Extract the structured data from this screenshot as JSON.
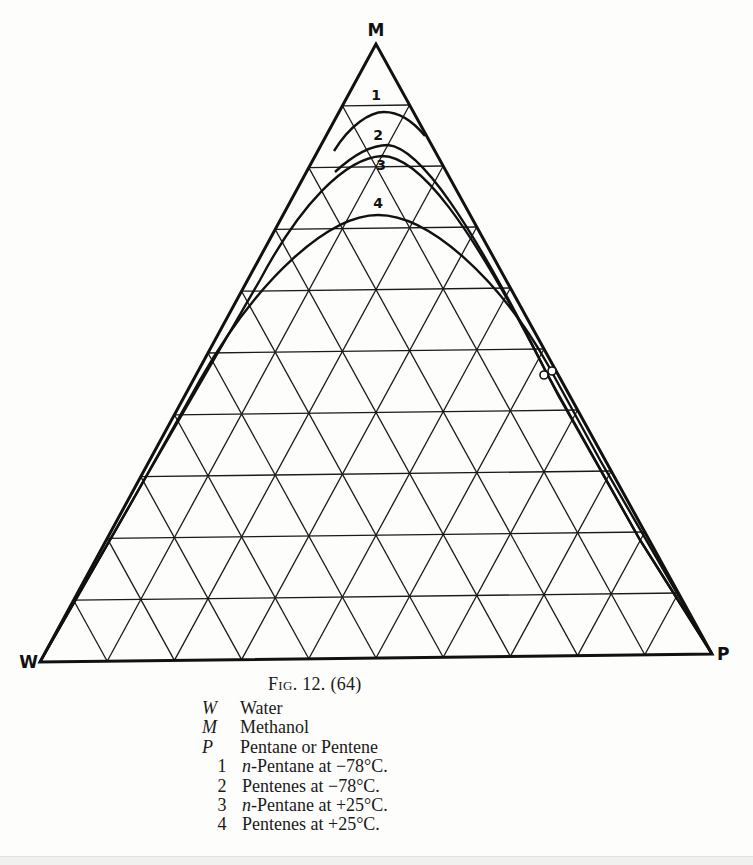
{
  "figure": {
    "title_prefix": "F",
    "title_smallcaps": "IG",
    "title_rest": ". 12. (64)",
    "full_title": "Fig. 12. (64)"
  },
  "vertices": {
    "top": {
      "label": "M",
      "x": 376,
      "y": 44
    },
    "left": {
      "label": "W",
      "x": 40,
      "y": 662
    },
    "right": {
      "label": "P",
      "x": 712,
      "y": 654
    }
  },
  "grid": {
    "divisions": 10,
    "line_color": "#1a1a1a"
  },
  "legend": [
    {
      "key": "W",
      "type": "symbol",
      "text": "Water"
    },
    {
      "key": "M",
      "type": "symbol",
      "text": "Methanol"
    },
    {
      "key": "P",
      "type": "symbol",
      "text": "Pentane or Pentene"
    },
    {
      "key": "1",
      "type": "number",
      "prefix_italic": "n",
      "text": "-Pentane at −78°C."
    },
    {
      "key": "2",
      "type": "number",
      "prefix_italic": "",
      "text": "Pentenes at −78°C."
    },
    {
      "key": "3",
      "type": "number",
      "prefix_italic": "n",
      "text": "-Pentane at +25°C."
    },
    {
      "key": "4",
      "type": "number",
      "prefix_italic": "",
      "text": "Pentenes at +25°C."
    }
  ],
  "curves": [
    {
      "id": "1",
      "label": "1",
      "label_pos": [
        376,
        100
      ],
      "path": "M 334 151 C 350 125, 370 112, 384 112 C 398 112, 412 120, 425 136"
    },
    {
      "id": "2",
      "label": "2",
      "label_pos": [
        378,
        140
      ],
      "path": "M 335 172 C 350 158, 368 145, 388 145 C 420 148, 470 220, 545 370 L 556 390 L 640 540 L 712 654"
    },
    {
      "id": "3",
      "label": "3",
      "label_pos": [
        381,
        170
      ],
      "path": "M 40 662 L 150 470 L 260 280 C 300 205, 345 158, 382 156 C 420 156, 470 225, 540 360 L 558 395 L 640 540 L 712 654"
    },
    {
      "id": "4",
      "label": "4",
      "label_pos": [
        378,
        208
      ],
      "path": "M 40 662 L 130 505 L 200 380 C 260 275, 330 215, 378 215 C 430 215, 500 280, 548 365 L 600 460 L 712 654"
    }
  ],
  "markers": [
    {
      "name": "tie-point-left",
      "cx": 544,
      "cy": 375,
      "r": 4
    },
    {
      "name": "tie-point-right",
      "cx": 552,
      "cy": 371,
      "r": 4
    }
  ],
  "colors": {
    "ink": "#111111",
    "paper": "#fdfdfc"
  }
}
